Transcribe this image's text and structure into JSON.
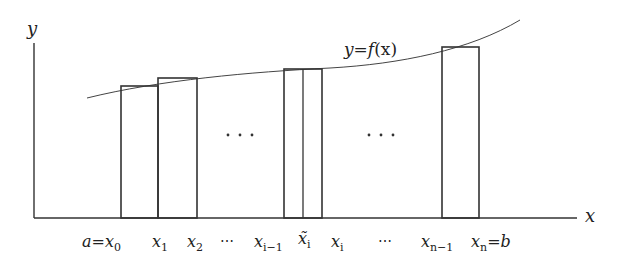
{
  "diagram": {
    "axes": {
      "y_label": "y",
      "x_label": "x",
      "y_axis": {
        "x": 34,
        "top": 43,
        "bottom": 218
      },
      "x_axis": {
        "y": 218,
        "left": 34,
        "right": 577
      }
    },
    "curve": {
      "label": "y = f(x)",
      "label_parts": {
        "lhs": "y",
        "eq": "=",
        "f": "f",
        "arg": "(x)"
      }
    },
    "rectangles": [
      {
        "name": "rect-1",
        "x0": 121,
        "x1": 158,
        "top": 86
      },
      {
        "name": "rect-2",
        "x0": 158,
        "x1": 197,
        "top": 78
      },
      {
        "name": "rect-i",
        "x0": 284,
        "x1": 322,
        "top": 69,
        "sample_line": 303
      },
      {
        "name": "rect-n",
        "x0": 442,
        "x1": 479,
        "top": 47
      }
    ],
    "middle_dots": [
      "⋯",
      "⋯"
    ],
    "tick_labels": [
      {
        "id": "a-x0",
        "main": "a",
        "eq": "=",
        "var": "x",
        "sub": "0",
        "x": 84
      },
      {
        "id": "x1",
        "var": "x",
        "sub": "1",
        "x": 152
      },
      {
        "id": "x2",
        "var": "x",
        "sub": "2",
        "x": 187
      },
      {
        "id": "dots-left",
        "text": "⋯",
        "x": 220
      },
      {
        "id": "x-im1",
        "var": "x",
        "sub": "i−1",
        "x": 255
      },
      {
        "id": "x-tilde-i",
        "var": "x̃",
        "sub": "i",
        "x": 298
      },
      {
        "id": "x-i",
        "var": "x",
        "sub": "i",
        "x": 332
      },
      {
        "id": "dots-right",
        "text": "⋯",
        "x": 378
      },
      {
        "id": "x-nm1",
        "var": "x",
        "sub": "n−1",
        "x": 421
      },
      {
        "id": "xn-b",
        "var": "x",
        "sub": "n",
        "eq": "=",
        "main": "b",
        "x": 472
      }
    ]
  }
}
